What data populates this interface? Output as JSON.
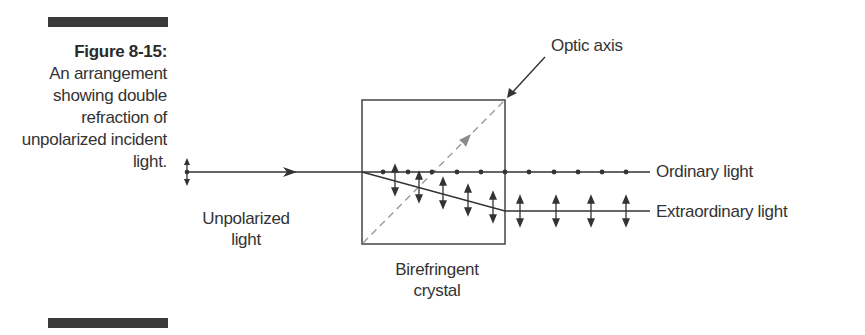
{
  "figure": {
    "number": "Figure 8-15:",
    "caption": "An arrangement showing double refraction of unpolarized incident light."
  },
  "labels": {
    "incident": "Unpolarized light",
    "incident_line1": "Unpolarized",
    "incident_line2": "light",
    "crystal_line1": "Birefringent",
    "crystal_line2": "crystal",
    "optic_axis": "Optic axis",
    "ordinary": "Ordinary light",
    "extraordinary": "Extraordinary light"
  },
  "colors": {
    "line": "#333333",
    "optic_axis_dashed": "#9a9a9a",
    "bar": "#3a3a3a"
  }
}
